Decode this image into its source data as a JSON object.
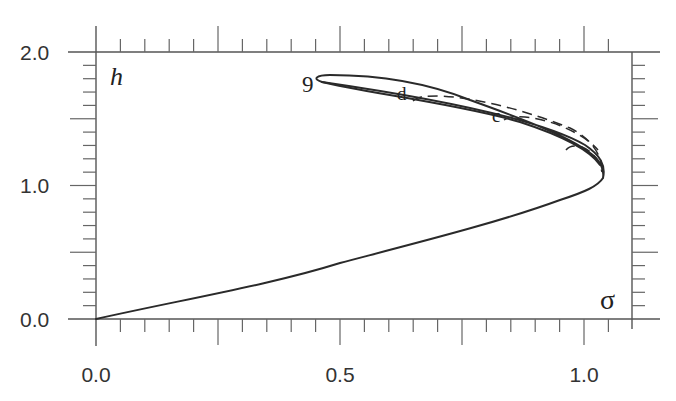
{
  "chart_data": {
    "type": "line",
    "title": "",
    "xlabel": "σ",
    "ylabel": "h",
    "xlim": [
      0.0,
      1.1
    ],
    "ylim": [
      0.0,
      2.0
    ],
    "x_ticks": [
      "0.0",
      "0.5",
      "1.0"
    ],
    "y_ticks": [
      "0.0",
      "1.0",
      "2.0"
    ],
    "x_major_step": 0.25,
    "x_minor_step": 0.05,
    "y_major_step": 0.5,
    "y_minor_step": 0.1,
    "grid": false,
    "legend": null,
    "series": [
      {
        "name": "9",
        "style": "solid",
        "points": [
          [
            0.0,
            0.0
          ],
          [
            0.1,
            0.11
          ],
          [
            0.2,
            0.22
          ],
          [
            0.3,
            0.34
          ],
          [
            0.4,
            0.46
          ],
          [
            0.5,
            0.59
          ],
          [
            0.6,
            0.72
          ],
          [
            0.7,
            0.85
          ],
          [
            0.8,
            0.95
          ],
          [
            0.9,
            1.0
          ],
          [
            0.98,
            1.02
          ],
          [
            1.04,
            1.06
          ],
          [
            1.03,
            1.2
          ],
          [
            0.98,
            1.33
          ],
          [
            0.9,
            1.44
          ],
          [
            0.8,
            1.53
          ],
          [
            0.7,
            1.61
          ],
          [
            0.6,
            1.67
          ],
          [
            0.5,
            1.72
          ],
          [
            0.466,
            1.775
          ],
          [
            0.5,
            1.82
          ],
          [
            0.6,
            1.8
          ],
          [
            0.7,
            1.74
          ],
          [
            0.8,
            1.64
          ],
          [
            0.9,
            1.53
          ],
          [
            0.98,
            1.41
          ],
          [
            1.03,
            1.25
          ],
          [
            1.04,
            1.06
          ]
        ]
      },
      {
        "name": "d",
        "style": "dashed",
        "points": [
          [
            0.65,
            1.65
          ],
          [
            0.7,
            1.66
          ],
          [
            0.8,
            1.59
          ],
          [
            0.9,
            1.49
          ],
          [
            0.98,
            1.37
          ],
          [
            1.03,
            1.2
          ],
          [
            1.04,
            1.06
          ]
        ]
      },
      {
        "name": "c",
        "style": "dashed",
        "points": [
          [
            0.83,
            1.5
          ],
          [
            0.9,
            1.47
          ],
          [
            0.98,
            1.38
          ],
          [
            1.03,
            1.22
          ],
          [
            1.04,
            1.06
          ]
        ]
      },
      {
        "name": "",
        "style": "dashed",
        "points": [
          [
            0.96,
            1.34
          ],
          [
            1.0,
            1.32
          ],
          [
            1.03,
            1.22
          ],
          [
            1.04,
            1.06
          ]
        ]
      }
    ],
    "annotations": [
      {
        "text": "9",
        "x": 0.43,
        "y": 1.78
      },
      {
        "text": "d",
        "x": 0.63,
        "y": 1.68
      },
      {
        "text": "c",
        "x": 0.82,
        "y": 1.52
      }
    ]
  },
  "labels": {
    "x_axis": "σ",
    "y_axis": "h",
    "x_tick_0": "0.0",
    "x_tick_1": "0.5",
    "x_tick_2": "1.0",
    "y_tick_0": "0.0",
    "y_tick_1": "1.0",
    "y_tick_2": "2.0",
    "curve_9": "9",
    "curve_d": "d",
    "curve_c": "c"
  }
}
